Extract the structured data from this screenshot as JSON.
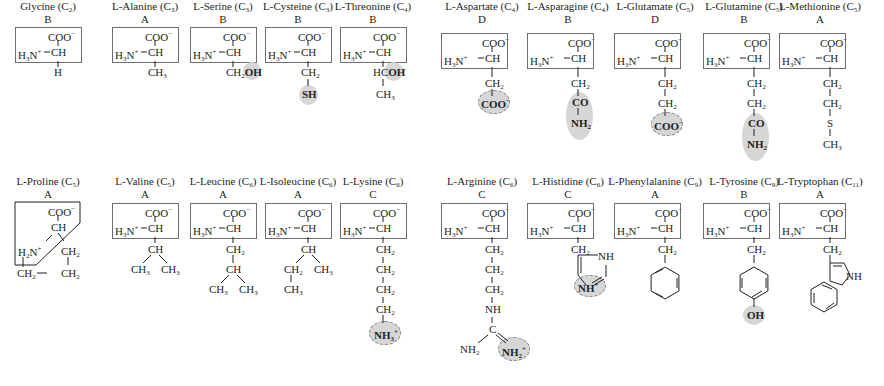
{
  "figure": {
    "row1": [
      {
        "id": "glycine",
        "name": "Glycine (C",
        "carbons": "2",
        "class": "B",
        "side": [
          "H"
        ]
      },
      {
        "id": "alanine",
        "name": "L-Alanine (C",
        "carbons": "3",
        "class": "A",
        "side": [
          "CH3"
        ]
      },
      {
        "id": "serine",
        "name": "L-Serine (C",
        "carbons": "3",
        "class": "B",
        "side": [
          "CH2OH"
        ],
        "highlight": "OH"
      },
      {
        "id": "cysteine",
        "name": "L-Cysteine (C",
        "carbons": "3",
        "class": "B",
        "side": [
          "CH2",
          "SH"
        ],
        "highlight": "SH"
      },
      {
        "id": "threonine",
        "name": "L-Threonine (C",
        "carbons": "4",
        "class": "B",
        "side": [
          "HCOH",
          "CH3"
        ],
        "highlight": "OH"
      },
      {
        "id": "aspartate",
        "name": "L-Aspartate (C",
        "carbons": "4",
        "class": "D",
        "side": [
          "CH2",
          "COO-"
        ],
        "highlight": "COO-"
      },
      {
        "id": "asparagine",
        "name": "L-Asparagine (C",
        "carbons": "4",
        "class": "B",
        "side": [
          "CH2",
          "CO",
          "NH2"
        ],
        "highlight": "CONH2"
      },
      {
        "id": "glutamate",
        "name": "L-Glutamate (C",
        "carbons": "5",
        "class": "D",
        "side": [
          "CH2",
          "CH2",
          "COO-"
        ],
        "highlight": "COO-"
      },
      {
        "id": "glutamine",
        "name": "L-Glutamine (C",
        "carbons": "5",
        "class": "B",
        "side": [
          "CH2",
          "CH2",
          "CO",
          "NH2"
        ],
        "highlight": "CONH2"
      },
      {
        "id": "methionine",
        "name": "L-Methionine (C",
        "carbons": "5",
        "class": "A",
        "side": [
          "CH2",
          "CH2",
          "S",
          "CH3"
        ]
      }
    ],
    "row2": [
      {
        "id": "proline",
        "name": "L-Proline (C",
        "carbons": "5",
        "class": "A",
        "side": [
          "CH2",
          "CH2",
          "CH2"
        ]
      },
      {
        "id": "valine",
        "name": "L-Valine (C",
        "carbons": "5",
        "class": "A",
        "side": [
          "CH",
          "CH3",
          "CH3"
        ]
      },
      {
        "id": "leucine",
        "name": "L-Leucine (C",
        "carbons": "6",
        "class": "A",
        "side": [
          "CH2",
          "CH",
          "CH3",
          "CH3"
        ]
      },
      {
        "id": "isoleucine",
        "name": "L-Isoleucine (C",
        "carbons": "6",
        "class": "A",
        "side": [
          "CH",
          "CH2",
          "CH3",
          "CH3"
        ]
      },
      {
        "id": "lysine",
        "name": "L-Lysine (C",
        "carbons": "6",
        "class": "C",
        "side": [
          "CH2",
          "CH2",
          "CH2",
          "CH2",
          "NH3+"
        ],
        "highlight": "NH3+"
      },
      {
        "id": "arginine",
        "name": "L-Arginine (C",
        "carbons": "6",
        "class": "C",
        "side": [
          "CH2",
          "CH2",
          "CH2",
          "NH",
          "C",
          "NH2",
          "NH2+"
        ],
        "highlight": "NH2+"
      },
      {
        "id": "histidine",
        "name": "L-Histidine (C",
        "carbons": "6",
        "class": "C",
        "side": [
          "CH2",
          "imidazole",
          "NH",
          "NH+"
        ],
        "highlight": "NH+"
      },
      {
        "id": "phenylalanine",
        "name": "L-Phenylalanine (C",
        "carbons": "9",
        "class": "A",
        "side": [
          "CH2",
          "phenyl"
        ]
      },
      {
        "id": "tyrosine",
        "name": "L-Tyrosine (C",
        "carbons": "9",
        "class": "B",
        "side": [
          "CH2",
          "phenol",
          "OH"
        ],
        "highlight": "OH"
      },
      {
        "id": "tryptophan",
        "name": "L-Tryptophan (C",
        "carbons": "11",
        "class": "A",
        "side": [
          "CH2",
          "indole",
          "NH"
        ]
      }
    ],
    "labels": {
      "coo": "COO",
      "minus": "−",
      "h3n": "H",
      "n": "N",
      "plus": "+",
      "ch": "CH",
      "h": "H",
      "ch2": "CH",
      "ch3": "CH",
      "oh": "OH",
      "sh": "SH",
      "hc": "HC",
      "co": "CO",
      "nh": "NH",
      "nh2": "NH",
      "nh3": "NH",
      "s": "S",
      "c": "C",
      "h2n": "H",
      "three": "3",
      "two": "2",
      "close": ")"
    }
  }
}
